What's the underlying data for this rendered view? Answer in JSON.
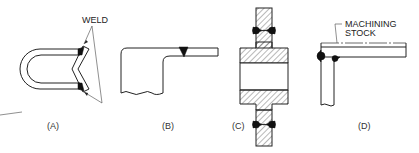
{
  "figure": {
    "panels": [
      {
        "id": "A",
        "caption": "(A)",
        "callout": "WELD",
        "description": "U-bend tube joined to a V-shaped part with two fillet welds"
      },
      {
        "id": "B",
        "caption": "(B)",
        "description": "Stepped block with thin plate butt-welded at top"
      },
      {
        "id": "C",
        "caption": "(C)",
        "description": "Cross-hatched flanged hub section welded to plate above and below"
      },
      {
        "id": "D",
        "caption": "(D)",
        "callout": "MACHINING STOCK",
        "description": "Corner joint with horizontal plate over vertical plate, machining stock allowance"
      }
    ]
  },
  "colors": {
    "line": "#222222",
    "weld_fill": "#111111",
    "background": "#ffffff"
  }
}
